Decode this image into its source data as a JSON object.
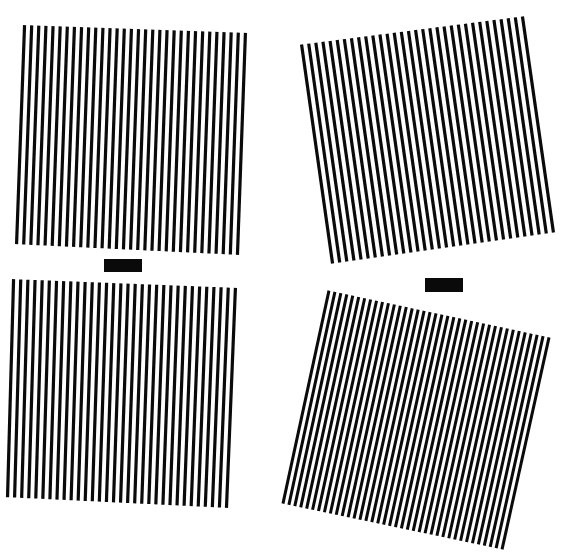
{
  "canvas": {
    "width": 568,
    "height": 558,
    "background": "#ffffff",
    "ink": "#0a0a0a"
  },
  "figure": {
    "gratings": [
      {
        "name": "grating-top-left",
        "corners": [
          [
            21,
            25
          ],
          [
            249,
            33
          ],
          [
            241,
            255
          ],
          [
            13,
            244
          ]
        ],
        "line_count": 32,
        "line_width": 3.2
      },
      {
        "name": "grating-top-right",
        "corners": [
          [
            298,
            45
          ],
          [
            526,
            16
          ],
          [
            557,
            232
          ],
          [
            329,
            264
          ]
        ],
        "line_count": 32,
        "line_width": 3.2
      },
      {
        "name": "grating-bottom-left",
        "corners": [
          [
            10,
            279
          ],
          [
            239,
            288
          ],
          [
            230,
            508
          ],
          [
            4,
            497
          ]
        ],
        "line_count": 32,
        "line_width": 3.2
      },
      {
        "name": "grating-bottom-right",
        "corners": [
          [
            326,
            290
          ],
          [
            552,
            338
          ],
          [
            505,
            550
          ],
          [
            280,
            503
          ]
        ],
        "line_count": 38,
        "line_width": 3.0
      }
    ],
    "bars": [
      {
        "name": "bar-left",
        "x": 104,
        "y": 259,
        "w": 38,
        "h": 13
      },
      {
        "name": "bar-right",
        "x": 425,
        "y": 278,
        "w": 38,
        "h": 14
      }
    ]
  }
}
